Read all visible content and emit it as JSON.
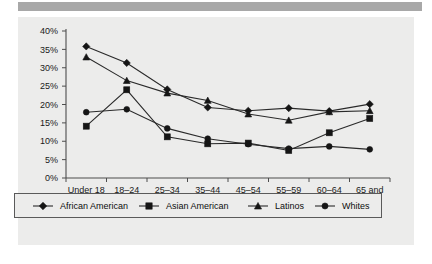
{
  "banner": {
    "name": "top-gray-bar"
  },
  "chart_data": {
    "type": "line",
    "title": "",
    "xlabel": "Age",
    "ylabel": "",
    "categories": [
      "Under 18",
      "18–24",
      "25–34",
      "35–44",
      "45–54",
      "55–59",
      "60–64",
      "65 and Over"
    ],
    "ylim": [
      0,
      40
    ],
    "ytick_labels": [
      "0%",
      "5%",
      "10%",
      "15%",
      "20%",
      "25%",
      "30%",
      "35%",
      "40%"
    ],
    "ytick_values": [
      0,
      5,
      10,
      15,
      20,
      25,
      30,
      35,
      40
    ],
    "grid": false,
    "legend_position": "bottom",
    "series": [
      {
        "name": "African American",
        "marker": "diamond",
        "values": [
          35.8,
          31.3,
          24.1,
          19.2,
          18.3,
          19.0,
          18.2,
          20.1
        ]
      },
      {
        "name": "Asian American",
        "marker": "square",
        "values": [
          14.1,
          24.0,
          11.2,
          9.3,
          9.5,
          7.5,
          12.3,
          16.2
        ]
      },
      {
        "name": "Latinos",
        "marker": "triangle",
        "values": [
          32.9,
          26.5,
          23.1,
          21.1,
          17.4,
          15.7,
          18.0,
          18.3
        ]
      },
      {
        "name": "Whites",
        "marker": "circle",
        "values": [
          17.9,
          18.7,
          13.5,
          10.7,
          9.2,
          8.0,
          8.6,
          7.8
        ]
      }
    ]
  },
  "legend": {
    "entries": [
      {
        "label": "African American",
        "marker": "diamond"
      },
      {
        "label": "Asian American",
        "marker": "square"
      },
      {
        "label": "Latinos",
        "marker": "triangle"
      },
      {
        "label": "Whites",
        "marker": "circle"
      }
    ]
  },
  "colors": {
    "plot_background": "#ececeb",
    "banner": "#a8a8a8",
    "series_ink": "#151515",
    "axis": "#4d4d4d"
  }
}
